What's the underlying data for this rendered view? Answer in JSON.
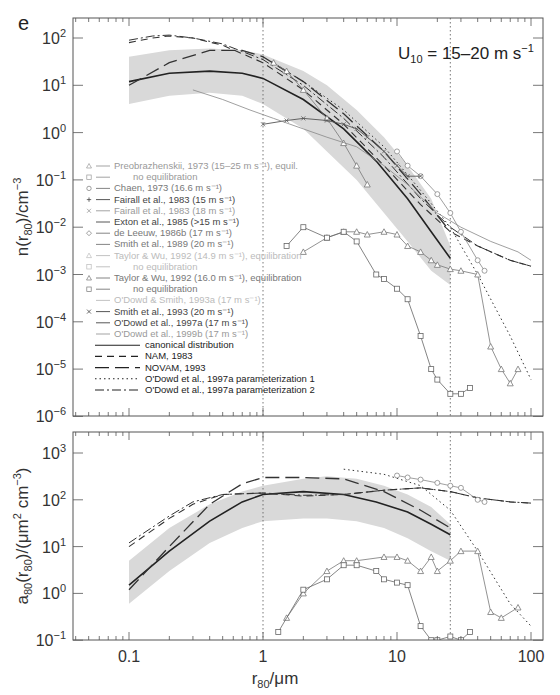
{
  "figure": {
    "panel_label": "e",
    "annotation": {
      "main": "U",
      "sub": "10",
      "rest": " = 15–20 m s",
      "sup": "−1"
    }
  },
  "chart_data": [
    {
      "type": "line",
      "title": "",
      "xlabel": "r80/μm",
      "ylabel": "n(r80)/cm^-3",
      "xscale": "log",
      "yscale": "log",
      "xlim": [
        0.038,
        100
      ],
      "ylim": [
        1e-06,
        250
      ],
      "y_ticks": [
        "10^2",
        "10^1",
        "10^0",
        "10^-1",
        "10^-2",
        "10^-3",
        "10^-4",
        "10^-5",
        "10^-6"
      ],
      "grid": false,
      "vlines": [
        1,
        25
      ],
      "shaded_band": {
        "x": [
          0.1,
          0.2,
          0.4,
          0.7,
          1,
          2,
          3,
          5,
          8,
          12,
          18,
          25
        ],
        "lower": [
          4,
          6,
          7,
          6,
          4,
          1.2,
          0.4,
          0.1,
          0.02,
          0.005,
          0.0012,
          0.0006
        ],
        "upper": [
          40,
          55,
          60,
          55,
          45,
          20,
          10,
          3,
          0.8,
          0.2,
          0.04,
          0.004
        ]
      },
      "legend": [
        {
          "label": "Preobrazhenskii, 1973 (15–25 m s⁻¹), equil.",
          "style": "solid-triangle",
          "shade": "light"
        },
        {
          "label": "no equilibration",
          "style": "solid-square",
          "shade": "light",
          "indent": true
        },
        {
          "label": "Chaen, 1973 (16.6 m s⁻¹)",
          "style": "solid-circle",
          "shade": "mid"
        },
        {
          "label": "Fairall et al., 1983 (15 m s⁻¹)",
          "style": "solid-plus",
          "shade": "dark"
        },
        {
          "label": "Fairall et al., 1983 (18 m s⁻¹)",
          "style": "solid-x",
          "shade": "light"
        },
        {
          "label": "Exton et al., 1985 (>15 m s⁻¹)",
          "style": "solid",
          "shade": "dark"
        },
        {
          "label": "de Leeuw, 1986b (17 m s⁻¹)",
          "style": "solid-diamond",
          "shade": "mid"
        },
        {
          "label": "Smith et al., 1989 (20 m s⁻¹)",
          "style": "solid",
          "shade": "mid"
        },
        {
          "label": "Taylor & Wu, 1992 (14.9 m s⁻¹), equilibration",
          "style": "solid-triangle",
          "shade": "faint"
        },
        {
          "label": "no equilibration",
          "style": "solid-square",
          "shade": "faint",
          "indent": true
        },
        {
          "label": "Taylor & Wu, 1992 (16.0 m s⁻¹), equilibration",
          "style": "solid-triangle",
          "shade": "mid"
        },
        {
          "label": "no equilibration",
          "style": "solid-square",
          "shade": "mid",
          "indent": true
        },
        {
          "label": "O'Dowd & Smith, 1993a (17 m s⁻¹)",
          "style": "solid",
          "shade": "faint"
        },
        {
          "label": "Smith et al., 1993 (20 m s⁻¹)",
          "style": "solid-x",
          "shade": "dark"
        },
        {
          "label": "O'Dowd et al., 1997a (17 m s⁻¹)",
          "style": "solid",
          "shade": "dark"
        },
        {
          "label": "O'Dowd et al., 1999b (17 m s⁻¹)",
          "style": "solid",
          "shade": "light"
        },
        {
          "label": "canonical distribution",
          "style": "solid-long",
          "shade": "black"
        },
        {
          "label": "NAM, 1983",
          "style": "dashed",
          "shade": "black"
        },
        {
          "label": "NOVAM, 1993",
          "style": "longdash",
          "shade": "black"
        },
        {
          "label": "O'Dowd et al., 1997a parameterization 1",
          "style": "dotted",
          "shade": "black"
        },
        {
          "label": "O'Dowd et al., 1997a parameterization 2",
          "style": "dashdot",
          "shade": "black"
        }
      ],
      "series": [
        {
          "name": "canonical distribution",
          "x": [
            0.1,
            0.2,
            0.4,
            0.7,
            1,
            2,
            4,
            7,
            12,
            18,
            25
          ],
          "y": [
            12,
            18,
            20,
            18,
            14,
            5,
            1.2,
            0.25,
            0.04,
            0.008,
            0.0022
          ]
        },
        {
          "name": "NAM, 1983",
          "x": [
            0.1,
            0.15,
            0.2,
            0.3,
            0.5,
            1,
            2,
            4,
            8,
            15,
            25,
            40,
            70,
            100
          ],
          "y": [
            80,
            100,
            110,
            100,
            70,
            30,
            8,
            1.5,
            0.2,
            0.03,
            0.008,
            0.004,
            0.002,
            0.0015
          ]
        },
        {
          "name": "NOVAM, 1993",
          "x": [
            0.1,
            0.2,
            0.4,
            0.7,
            1,
            2,
            4,
            8,
            15,
            25
          ],
          "y": [
            10,
            30,
            55,
            55,
            40,
            12,
            2.5,
            0.4,
            0.05,
            0.008
          ]
        },
        {
          "name": "O'Dowd et al., 1997a parameterization 1",
          "x": [
            1,
            2,
            4,
            8,
            15,
            25,
            40,
            70,
            100
          ],
          "y": [
            40,
            12,
            3,
            0.5,
            0.06,
            0.01,
            0.001,
            5e-05,
            6e-06
          ]
        },
        {
          "name": "O'Dowd et al., 1997a parameterization 2",
          "x": [
            0.1,
            0.15,
            0.2,
            0.3,
            0.5,
            1,
            2,
            4,
            8,
            15,
            25,
            40,
            70,
            100
          ],
          "y": [
            90,
            110,
            115,
            100,
            75,
            35,
            10,
            2,
            0.3,
            0.04,
            0.01,
            0.004,
            0.002,
            0.0015
          ]
        },
        {
          "name": "Preobrazhenskii, 1973, equil.",
          "x": [
            1.2,
            1.5,
            2,
            3,
            4,
            5,
            6
          ],
          "y": [
            30,
            20,
            8,
            2,
            0.6,
            0.2,
            0.08
          ]
        },
        {
          "name": "Chaen, 1973 (16.6 m/s)",
          "x": [
            10,
            12,
            15,
            20,
            25,
            30,
            40,
            45
          ],
          "y": [
            0.4,
            0.2,
            0.12,
            0.05,
            0.02,
            0.008,
            0.002,
            0.0012
          ]
        },
        {
          "name": "Smith et al., 1993 (20 m/s)",
          "x": [
            1,
            1.5,
            2,
            3,
            4,
            5,
            6,
            8,
            10,
            12,
            15
          ],
          "y": [
            1.5,
            1.8,
            2,
            1.8,
            1.5,
            1.2,
            0.8,
            0.4,
            0.2,
            0.12,
            0.12
          ]
        },
        {
          "name": "Taylor & Wu, 1992 (16.0), equilibration",
          "x": [
            2,
            3,
            4,
            5,
            6,
            8,
            10,
            12,
            15,
            18,
            20,
            25,
            30,
            40,
            50,
            60,
            70,
            80
          ],
          "y": [
            0.003,
            0.006,
            0.008,
            0.008,
            0.007,
            0.008,
            0.007,
            0.004,
            0.003,
            0.002,
            0.0016,
            0.0013,
            0.0012,
            0.001,
            3e-05,
            1e-05,
            5e-06,
            1e-05
          ]
        },
        {
          "name": "Taylor & Wu, 1992 (16.0), no equilibration",
          "x": [
            1.5,
            2,
            3,
            4,
            5,
            7,
            8,
            10,
            12,
            15,
            18,
            20,
            25,
            30,
            35
          ],
          "y": [
            0.004,
            0.01,
            0.006,
            0.008,
            0.005,
            0.001,
            0.0008,
            0.0005,
            0.0003,
            5e-05,
            1e-05,
            6e-06,
            3e-06,
            3e-06,
            4e-06
          ]
        },
        {
          "name": "Smith et al., 1989 (20 m/s)",
          "x": [
            0.3,
            0.5,
            0.8,
            1.2,
            2,
            3,
            5,
            8,
            12,
            20,
            30,
            50,
            80,
            100
          ],
          "y": [
            8,
            5,
            3,
            2,
            1.2,
            0.8,
            0.5,
            0.2,
            0.08,
            0.02,
            0.01,
            0.005,
            0.003,
            0.002
          ]
        }
      ]
    },
    {
      "type": "line",
      "title": "",
      "xlabel": "r80/μm",
      "ylabel": "a80(r80)/(μm^2 cm^-3)",
      "xscale": "log",
      "yscale": "log",
      "xlim": [
        0.038,
        100
      ],
      "ylim": [
        0.1,
        2800
      ],
      "x_ticks": [
        "0.1",
        "1",
        "10",
        "100"
      ],
      "y_ticks": [
        "10^3",
        "10^2",
        "10^1",
        "10^0",
        "10^-1"
      ],
      "grid": false,
      "vlines": [
        1,
        25
      ],
      "shaded_band": {
        "x": [
          0.1,
          0.2,
          0.4,
          0.7,
          1,
          2,
          3,
          5,
          8,
          12,
          18,
          25
        ],
        "lower": [
          0.6,
          3,
          12,
          25,
          35,
          40,
          40,
          35,
          25,
          15,
          8,
          5
        ],
        "upper": [
          5,
          25,
          80,
          150,
          200,
          280,
          320,
          280,
          200,
          130,
          70,
          30
        ]
      },
      "series": [
        {
          "name": "canonical distribution",
          "x": [
            0.1,
            0.2,
            0.4,
            0.7,
            1,
            2,
            4,
            7,
            12,
            18,
            25
          ],
          "y": [
            1.5,
            8,
            35,
            90,
            130,
            150,
            130,
            90,
            55,
            30,
            18
          ]
        },
        {
          "name": "NAM, 1983",
          "x": [
            0.1,
            0.2,
            0.3,
            0.5,
            1,
            2,
            4,
            8,
            15,
            25,
            40,
            70,
            100
          ],
          "y": [
            10,
            40,
            80,
            130,
            140,
            120,
            130,
            160,
            180,
            150,
            110,
            90,
            85
          ]
        },
        {
          "name": "NOVAM, 1993",
          "x": [
            0.1,
            0.2,
            0.4,
            0.7,
            1,
            2,
            4,
            8,
            15,
            25
          ],
          "y": [
            1.2,
            10,
            80,
            220,
            300,
            300,
            280,
            150,
            60,
            25
          ]
        },
        {
          "name": "O'Dowd et al., 1997a parameterization 1",
          "x": [
            4,
            8,
            15,
            25,
            40,
            70,
            100
          ],
          "y": [
            450,
            350,
            200,
            60,
            8,
            0.6,
            0.2
          ]
        },
        {
          "name": "O'Dowd et al., 1997a parameterization 2",
          "x": [
            0.1,
            0.2,
            0.3,
            0.5,
            1,
            2,
            4,
            8,
            15,
            25,
            40,
            70,
            100
          ],
          "y": [
            12,
            45,
            90,
            130,
            140,
            125,
            130,
            160,
            180,
            150,
            110,
            90,
            85
          ]
        },
        {
          "name": "Chaen, 1973 (16.6 m/s)",
          "x": [
            10,
            12,
            15,
            20,
            25,
            30,
            40,
            45
          ],
          "y": [
            330,
            300,
            270,
            230,
            200,
            180,
            100,
            90
          ]
        },
        {
          "name": "Taylor & Wu, 1992 (16.0), equilibration",
          "x": [
            1.5,
            2,
            3,
            4,
            5,
            8,
            10,
            12,
            15,
            18,
            20,
            25,
            30,
            40,
            50,
            60,
            80
          ],
          "y": [
            0.3,
            1,
            3,
            5,
            5,
            6,
            6,
            5,
            3,
            6,
            3,
            5,
            8,
            8,
            0.4,
            0.3,
            0.5
          ]
        },
        {
          "name": "Taylor & Wu, 1992 (16.0), no equilibration",
          "x": [
            1.3,
            2,
            3,
            4,
            5,
            7,
            8,
            10,
            12,
            15,
            18,
            20,
            25,
            30,
            35
          ],
          "y": [
            0.15,
            1.2,
            2,
            4,
            4,
            3,
            2,
            1.7,
            1.5,
            0.2,
            0.1,
            0.1,
            0.12,
            0.1,
            0.15
          ]
        }
      ]
    }
  ]
}
